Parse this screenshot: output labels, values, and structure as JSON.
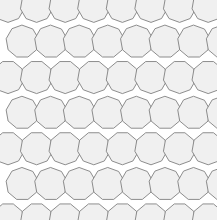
{
  "figure": {
    "canvas_width": 217,
    "canvas_height": 220,
    "background_color": "#ffffff"
  },
  "style": {
    "tile_fill": "#f0f0f0",
    "tile_stroke": "#808080",
    "tile_stroke_width": 0.9,
    "gap_fill": "#ffffff"
  },
  "chart_data": {
    "type": "scatter",
    "xlabel": "",
    "ylabel": "",
    "xlim": [
      0,
      217
    ],
    "ylim": [
      0,
      220
    ],
    "grid": false,
    "legend": "none",
    "lattice": {
      "shape": "nonagon",
      "sides": 9,
      "circumradius": 16.4,
      "column_spacing": 28.6,
      "row_spacing": 35.6,
      "row_offset": 14.3,
      "first_center_x": 8.0,
      "first_center_y": 6.0,
      "columns": 9,
      "rows": 7,
      "rotation_even_row_deg": 20,
      "rotation_odd_row_deg": 0
    },
    "centers_note": "Centers follow x = first_center_x + col*column_spacing + (row odd ? row_offset : 0), y = first_center_y + row*row_spacing",
    "values": [
      16.4
    ],
    "categories": [
      "circumradius"
    ]
  }
}
